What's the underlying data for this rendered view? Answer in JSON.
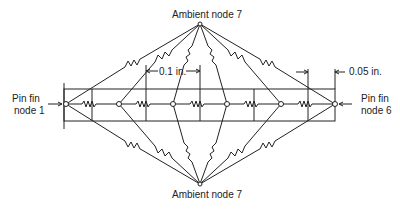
{
  "diagram": {
    "type": "thermal resistance network",
    "ambient_top_label": "Ambient node 7",
    "ambient_bottom_label": "Ambient node 7",
    "left_label_line1": "Pin fin",
    "left_label_line2": "node 1",
    "right_label_line1": "Pin fin",
    "right_label_line2": "node 6",
    "dim_segment_label": "0.1 in.",
    "dim_end_label": "0.05 in.",
    "nodes": [
      {
        "id": 1,
        "x": 66
      },
      {
        "id": 2,
        "x": 119
      },
      {
        "id": 3,
        "x": 173
      },
      {
        "id": 4,
        "x": 227
      },
      {
        "id": 5,
        "x": 281
      },
      {
        "id": 6,
        "x": 335
      }
    ],
    "ambient_node": 7,
    "colors": {
      "line": "#222222",
      "background": "#ffffff"
    }
  }
}
